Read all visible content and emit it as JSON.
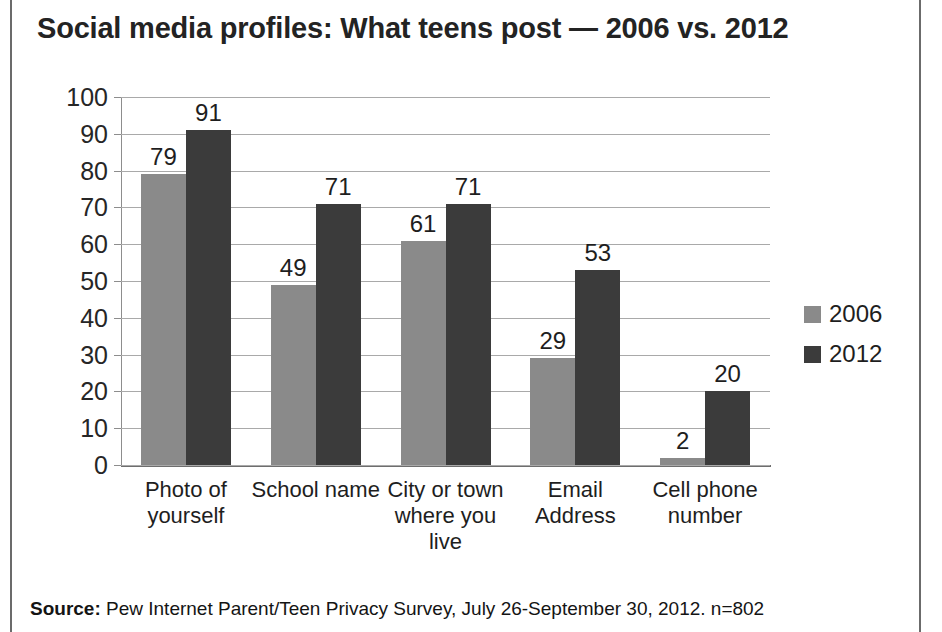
{
  "chart_data": {
    "type": "bar",
    "title": "Social media profiles: What teens post — 2006 vs. 2012",
    "xlabel": "",
    "ylabel": "",
    "ylim": [
      0,
      100
    ],
    "ytick_step": 10,
    "yticks": [
      "100",
      "90",
      "80",
      "70",
      "60",
      "50",
      "40",
      "30",
      "20",
      "10",
      "0"
    ],
    "grid": true,
    "legend_position": "right",
    "categories": [
      "Photo of yourself",
      "School name",
      "City or town where you live",
      "Email Address",
      "Cell phone number"
    ],
    "series": [
      {
        "name": "2006",
        "color": "#8a8a8a",
        "values": [
          79,
          49,
          61,
          29,
          2
        ]
      },
      {
        "name": "2012",
        "color": "#3b3b3b",
        "values": [
          91,
          71,
          71,
          53,
          20
        ]
      }
    ]
  },
  "source": {
    "lead": "Source:",
    "text": " Pew Internet Parent/Teen Privacy Survey, July 26-September 30, 2012. n=802"
  }
}
